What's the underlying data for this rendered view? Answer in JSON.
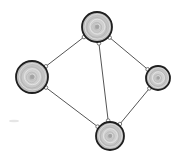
{
  "diagram": {
    "type": "undirected-graph",
    "style": "hand-drawn tree-ring nodes",
    "colors": {
      "background": "#ffffff",
      "node_fill": "#c8c8c8",
      "node_outline": "#1e1e1e",
      "edge": "#555555",
      "port_fill": "#ffffff"
    },
    "nodes": [
      {
        "id": "top",
        "cx": 97,
        "cy": 27,
        "r": 15
      },
      {
        "id": "left",
        "cx": 32,
        "cy": 77,
        "r": 16
      },
      {
        "id": "right",
        "cx": 158,
        "cy": 78,
        "r": 12
      },
      {
        "id": "bottom",
        "cx": 110,
        "cy": 136,
        "r": 14
      }
    ],
    "edges": [
      {
        "from": "top",
        "to": "left"
      },
      {
        "from": "top",
        "to": "right"
      },
      {
        "from": "top",
        "to": "bottom"
      },
      {
        "from": "left",
        "to": "bottom"
      },
      {
        "from": "right",
        "to": "bottom"
      }
    ]
  }
}
